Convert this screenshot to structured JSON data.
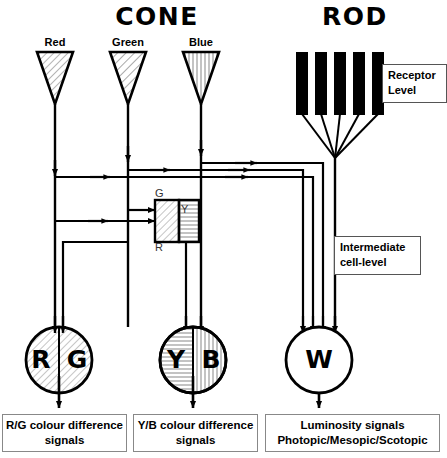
{
  "diagram": {
    "title_cone": "CONE",
    "title_rod": "ROD",
    "receptor_level_line1": "Receptor",
    "receptor_level_line2": "Level",
    "intermediate_line1": "Intermediate",
    "intermediate_line2": "cell-level"
  },
  "receptors": {
    "cones": [
      {
        "name": "Red",
        "fill": "diagonal-hatch-dense"
      },
      {
        "name": "Green",
        "fill": "diagonal-hatch"
      },
      {
        "name": "Blue",
        "fill": "vertical-hatch"
      }
    ],
    "rod_count": 5,
    "rod_fill": "#000000"
  },
  "opponent_box": {
    "label_top": "G",
    "label_bottom": "R",
    "label_right": "Y"
  },
  "cells": [
    {
      "left_label": "R",
      "right_label": "G",
      "name": "rg-cell"
    },
    {
      "left_label": "Y",
      "right_label": "B",
      "name": "yb-cell"
    },
    {
      "left_label": "W",
      "right_label": "",
      "name": "w-cell"
    }
  ],
  "outputs": [
    {
      "line1": "R/G colour difference",
      "line2": "signals"
    },
    {
      "line1": "Y/B colour difference",
      "line2": "signals"
    },
    {
      "line1": "Luminosity signals",
      "line2": "Photopic/Mesopic/Scotopic"
    }
  ],
  "colors": {
    "ink": "#000000",
    "paper": "#ffffff",
    "hatch": "#8a8a8a",
    "box_border": "#888888"
  }
}
